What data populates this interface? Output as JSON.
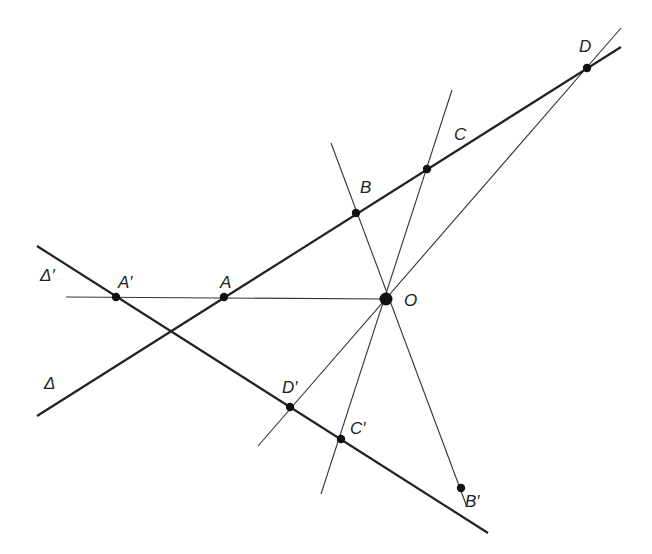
{
  "diagram": {
    "title": "",
    "lines": {
      "delta": {
        "label": "Δ",
        "x1": 37,
        "y1": 416,
        "x2": 621,
        "y2": 47
      },
      "delta_prime": {
        "label": "Δ′",
        "x1": 37,
        "y1": 246,
        "x2": 488,
        "y2": 533
      },
      "OA": {
        "x1": 66,
        "y1": 297,
        "x2": 386,
        "y2": 299
      },
      "OB": {
        "x1": 331,
        "y1": 143,
        "x2": 467,
        "y2": 507
      },
      "OC": {
        "x1": 452,
        "y1": 90,
        "x2": 321,
        "y2": 494
      },
      "OD": {
        "x1": 621,
        "y1": 28,
        "x2": 258,
        "y2": 446
      }
    },
    "points": [
      {
        "name": "A'",
        "label": "A′",
        "x": 116,
        "y": 297,
        "lx": 118,
        "ly": 288
      },
      {
        "name": "A",
        "label": "A",
        "x": 224,
        "y": 297,
        "lx": 220,
        "ly": 288
      },
      {
        "name": "O",
        "label": "O",
        "x": 386,
        "y": 299,
        "lx": 404,
        "ly": 306,
        "big": true
      },
      {
        "name": "B",
        "label": "B",
        "x": 356,
        "y": 213,
        "lx": 360,
        "ly": 193
      },
      {
        "name": "C",
        "label": "C",
        "x": 427,
        "y": 169,
        "lx": 454,
        "ly": 140
      },
      {
        "name": "D",
        "label": "D",
        "x": 587,
        "y": 68,
        "lx": 579,
        "ly": 52
      },
      {
        "name": "D'",
        "label": "D′",
        "x": 290,
        "y": 407,
        "lx": 282,
        "ly": 393
      },
      {
        "name": "C'",
        "label": "C′",
        "x": 341,
        "y": 439,
        "lx": 350,
        "ly": 434
      },
      {
        "name": "B'",
        "label": "B′",
        "x": 461,
        "y": 488,
        "lx": 465,
        "ly": 507
      }
    ],
    "line_labels": [
      {
        "name": "delta-prime-label",
        "text": "Δ′",
        "x": 40,
        "y": 281
      },
      {
        "name": "delta-label",
        "text": "Δ",
        "x": 44,
        "y": 389
      }
    ]
  }
}
